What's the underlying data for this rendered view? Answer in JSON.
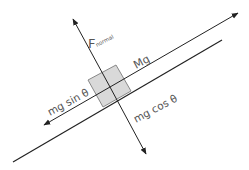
{
  "diagram": {
    "labels": {
      "normal_force_main": "F",
      "normal_force_sub": "normal",
      "gravity": "Mg",
      "parallel_component": "mg sin θ",
      "perpendicular_component": "mg cos θ"
    },
    "colors": {
      "line": "#222222",
      "text": "#555555",
      "block_fill": "#d9d9d9",
      "block_stroke": "#888888",
      "background": "#ffffff"
    }
  }
}
